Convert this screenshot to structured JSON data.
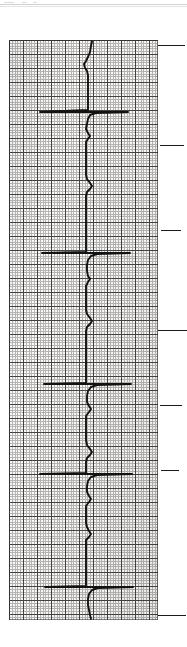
{
  "document": {
    "kind": "ecg-rhythm-strip-scan",
    "orientation": "rotated-90-vertical",
    "page_width": 187,
    "page_height": 647,
    "page_background": "#ffffff",
    "paper_background": "#fbfaf8",
    "ink_color": "#121212",
    "grid_minor_color": "#8c8c8c",
    "grid_major_color": "#3a3a3a",
    "tick_color": "#1a1a1a"
  },
  "scan_artifacts": {
    "top_edge_lines": [
      {
        "y": 4,
        "color": "#c9c9c9"
      },
      {
        "y": 6,
        "color": "#dedede"
      }
    ],
    "specks": [
      {
        "x": 4,
        "y": 2,
        "w": 10,
        "h": 1
      },
      {
        "x": 22,
        "y": 2,
        "w": 5,
        "h": 1
      },
      {
        "x": 33,
        "y": 2,
        "w": 4,
        "h": 1
      },
      {
        "x": 118,
        "y": 196,
        "w": 2,
        "h": 2
      },
      {
        "x": 140,
        "y": 318,
        "w": 2,
        "h": 2
      }
    ]
  },
  "strip": {
    "x": 9,
    "y": 40,
    "width": 149,
    "height": 580,
    "grid": {
      "minor_cell_px": 2.8,
      "major_cell_px": 14,
      "minor_line_width": 1,
      "major_line_width": 1,
      "visible": true
    },
    "baseline_x": 86,
    "trace_stroke_width": 1.9
  },
  "tick_marks": [
    {
      "name": "tick-1",
      "y": 45,
      "x": 158,
      "length": 27
    },
    {
      "name": "tick-2",
      "y": 145,
      "x": 160,
      "length": 24
    },
    {
      "name": "tick-3",
      "y": 230,
      "x": 161,
      "length": 20
    },
    {
      "name": "tick-4",
      "y": 330,
      "x": 158,
      "length": 29
    },
    {
      "name": "tick-5",
      "y": 405,
      "x": 160,
      "length": 22
    },
    {
      "name": "tick-6",
      "y": 470,
      "x": 161,
      "length": 18
    },
    {
      "name": "tick-7",
      "y": 615,
      "x": 158,
      "length": 28
    }
  ],
  "chart_data": {
    "type": "line",
    "title": "",
    "xlabel": "",
    "ylabel": "",
    "axis_mapping": {
      "time_axis": "vertical (top to bottom)",
      "voltage_axis": "horizontal (deflection to the left = positive R wave)",
      "paper_speed_small_box": "1 mm",
      "major_box_small_boxes": 5
    },
    "baseline_value": 86,
    "beat_count": 8,
    "beats": [
      {
        "index": 1,
        "qrs_time_px": 112,
        "r_peak_px": 38,
        "spike_extent_left": 38
      },
      {
        "index": 2,
        "qrs_time_px": 180,
        "r_peak_px": 40,
        "spike_extent_left": 40
      },
      {
        "index": 3,
        "qrs_time_px": 252,
        "r_peak_px": 41,
        "spike_extent_left": 41
      },
      {
        "index": 4,
        "qrs_time_px": 322,
        "r_peak_px": 44,
        "spike_extent_left": 44
      },
      {
        "index": 5,
        "qrs_time_px": 393,
        "r_peak_px": 40,
        "spike_extent_left": 40
      },
      {
        "index": 6,
        "qrs_time_px": 463,
        "r_peak_px": 45,
        "spike_extent_left": 45
      },
      {
        "index": 7,
        "qrs_time_px": 527,
        "r_peak_px": 48,
        "spike_extent_left": 48
      },
      {
        "index": 8,
        "qrs_time_px": 597,
        "r_peak_px": 50,
        "spike_extent_left": 50
      }
    ],
    "trace_path": "M 92 41 L 91 46 L 90 52 L 88 57 L 86 61 L 84 64 L 85 68 L 87 71 L 88 75 L 88 80 L 88 85 L 88 90 L 88 96 L 88 101 L 88 106 L 88 110 L 40 112 L 128 112 L 96 113 L 90 115 L 88 119 L 87 124 L 86 129 L 88 133 L 90 136 L 88 139 L 86 142 L 86 147 L 86 153 L 86 159 L 86 165 L 86 170 L 86 175 L 87 179 L 90 183 L 92 186 L 90 189 L 87 192 L 86 196 L 86 200 L 86 206 L 86 212 L 86 218 L 86 224 L 86 229 L 86 234 L 86 239 L 86 244 L 86 249 L 86 252 L 42 253 L 130 253 L 97 254 L 91 256 L 88 260 L 87 265 L 87 271 L 88 276 L 90 279 L 88 282 L 86 286 L 86 292 L 86 298 L 86 304 L 86 310 L 87 314 L 90 318 L 92 321 L 90 324 L 87 327 L 86 331 L 86 336 L 86 342 L 86 348 L 86 354 L 86 359 L 86 364 L 86 369 L 86 374 L 86 379 L 86 383 L 44 384 L 131 384 L 97 385 L 91 387 L 88 391 L 87 396 L 87 402 L 89 406 L 91 409 L 89 412 L 86 416 L 86 422 L 86 428 L 86 434 L 86 440 L 87 445 L 90 449 L 92 452 L 90 455 L 87 458 L 86 462 L 86 466 L 86 470 L 86 473 L 40 474 L 132 474 L 97 475 L 91 477 L 88 481 L 87 486 L 87 492 L 89 496 L 91 499 L 89 502 L 86 506 L 86 512 L 86 518 L 86 523 L 87 527 L 89 531 L 91 534 L 89 537 L 86 540 L 86 545 L 86 551 L 86 557 L 86 562 L 86 567 L 86 572 L 86 577 L 86 582 L 86 586 L 45 587 L 133 587 L 98 588 L 92 590 L 89 594 L 88 599 L 88 605 L 89 610 L 90 615 L 91 619"
  }
}
